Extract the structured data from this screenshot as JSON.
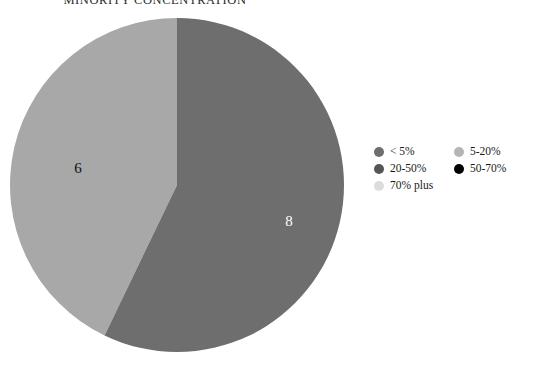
{
  "chart_data": {
    "type": "pie",
    "title": "MINORITY CONCENTRATION",
    "categories": [
      "< 5%",
      "5-20%",
      "20-50%",
      "50-70%",
      "70% plus"
    ],
    "values": [
      8,
      0,
      6,
      0,
      0
    ],
    "visible_slices": [
      {
        "label": "20-50%",
        "value": 6,
        "display": "6",
        "color": "#a8a8a8",
        "label_color": "dark",
        "start_angle": 205.7,
        "end_angle": 360.0
      },
      {
        "label": "< 5%",
        "value": 8,
        "display": "8",
        "color": "#6e6e6e",
        "label_color": "light",
        "start_angle": 0.0,
        "end_angle": 205.7
      }
    ],
    "total": 14,
    "xlabel": "",
    "ylabel": "",
    "grid": false,
    "legend_position": "right"
  },
  "title": {
    "text": "MINORITY CONCENTRATION"
  },
  "pie": {
    "center_x": 168,
    "center_y": 168,
    "radius": 167,
    "slice_a": {
      "display": "6",
      "color": "#a8a8a8",
      "label_x": 69,
      "label_y": 153
    },
    "slice_b": {
      "display": "8",
      "color": "#6e6e6e",
      "label_x": 280,
      "label_y": 206
    }
  },
  "legend": {
    "left_column": [
      {
        "label": "< 5%",
        "color": "#6e6e6e"
      },
      {
        "label": "20-50%",
        "color": "#555555"
      },
      {
        "label": "70% plus",
        "color": "#dcdcdc"
      }
    ],
    "right_column": [
      {
        "label": "5-20%",
        "color": "#b5b5b5"
      },
      {
        "label": "50-70%",
        "color": "#000000"
      }
    ]
  }
}
